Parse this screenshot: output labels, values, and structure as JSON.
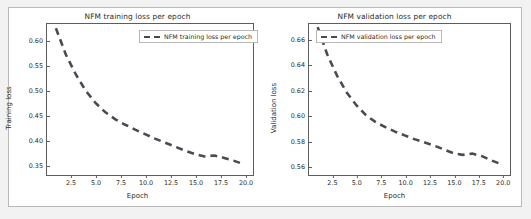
{
  "figure": {
    "background_color": "#f2f2f2",
    "panel_background": "#ffffff",
    "line_color": "#4a4a52",
    "axis_color": "#5d5d5d"
  },
  "chart_data": [
    {
      "type": "line",
      "title": "NFM training loss per epoch",
      "xlabel": "Epoch",
      "ylabel": "Training loss",
      "legend": [
        "NFM training loss per epoch"
      ],
      "legend_position": "upper right",
      "grid": false,
      "linestyle": "dashed",
      "color": "#4a4a52",
      "xlim": [
        0.1,
        20.9
      ],
      "ylim": [
        0.3285,
        0.6335
      ],
      "xticks": [
        "2.5",
        "5.0",
        "7.5",
        "10.0",
        "12.5",
        "15.0",
        "17.5",
        "20.0"
      ],
      "xtick_values": [
        2.5,
        5.0,
        7.5,
        10.0,
        12.5,
        15.0,
        17.5,
        20.0
      ],
      "yticks": [
        "0.35",
        "0.40",
        "0.45",
        "0.50",
        "0.55",
        "0.60"
      ],
      "ytick_values": [
        0.35,
        0.4,
        0.45,
        0.5,
        0.55,
        0.6
      ],
      "x": [
        1,
        2,
        3,
        4,
        5,
        6,
        7,
        8,
        9,
        10,
        11,
        12,
        13,
        14,
        15,
        16,
        17,
        18,
        19,
        20
      ],
      "values": [
        0.625,
        0.572,
        0.532,
        0.499,
        0.474,
        0.455,
        0.441,
        0.43,
        0.42,
        0.411,
        0.402,
        0.394,
        0.386,
        0.378,
        0.371,
        0.366,
        0.368,
        0.363,
        0.357,
        0.35
      ]
    },
    {
      "type": "line",
      "title": "NFM validation loss per epoch",
      "xlabel": "Epoch",
      "ylabel": "Validation loss",
      "legend": [
        "NFM validation loss per epoch"
      ],
      "legend_position": "upper left",
      "grid": false,
      "linestyle": "dashed",
      "color": "#4a4a52",
      "xlim": [
        0.1,
        20.9
      ],
      "ylim": [
        0.5525,
        0.6725
      ],
      "xticks": [
        "2.5",
        "5.0",
        "7.5",
        "10.0",
        "12.5",
        "15.0",
        "17.5",
        "20.0"
      ],
      "xtick_values": [
        2.5,
        5.0,
        7.5,
        10.0,
        12.5,
        15.0,
        17.5,
        20.0
      ],
      "yticks": [
        "0.56",
        "0.58",
        "0.60",
        "0.62",
        "0.64",
        "0.66"
      ],
      "ytick_values": [
        0.56,
        0.58,
        0.6,
        0.62,
        0.64,
        0.66
      ],
      "x": [
        1,
        2,
        3,
        4,
        5,
        6,
        7,
        8,
        9,
        10,
        11,
        12,
        13,
        14,
        15,
        16,
        17,
        18,
        19,
        20
      ],
      "values": [
        0.67,
        0.648,
        0.6315,
        0.618,
        0.608,
        0.6,
        0.5945,
        0.5905,
        0.587,
        0.584,
        0.581,
        0.5785,
        0.576,
        0.573,
        0.57,
        0.5685,
        0.5695,
        0.5675,
        0.564,
        0.561
      ]
    }
  ]
}
